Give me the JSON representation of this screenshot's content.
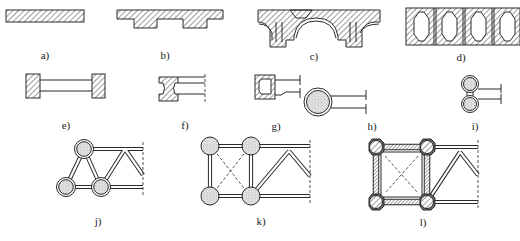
{
  "figure": {
    "panels": [
      {
        "id": "a",
        "label": "a)",
        "description": "solid rectangular plate section"
      },
      {
        "id": "b",
        "label": "b)",
        "description": "plate with two downward ribs"
      },
      {
        "id": "c",
        "label": "c)",
        "description": "double-arch section with hatched walls"
      },
      {
        "id": "d",
        "label": "d)",
        "description": "four hollow cells with octagonal voids"
      },
      {
        "id": "e",
        "label": "e)",
        "description": "two solid end blocks joined by web"
      },
      {
        "id": "f",
        "label": "f)",
        "description": "I-shaped flange member with web"
      },
      {
        "id": "g",
        "label": "g)",
        "description": "hollow box section with web lines"
      },
      {
        "id": "h",
        "label": "h)",
        "description": "concrete-filled circular tube with web"
      },
      {
        "id": "i",
        "label": "i)",
        "description": "two concrete-filled tubes stacked"
      },
      {
        "id": "j",
        "label": "j)",
        "description": "triangular truss with filled tube chords"
      },
      {
        "id": "k",
        "label": "k)",
        "description": "four-chord truss with filled tubes and cross bracing"
      },
      {
        "id": "l",
        "label": "l)",
        "description": "four-chord truss with encased chords and cross bracing"
      }
    ]
  },
  "colors": {
    "stroke": "#2a2a2a",
    "background": "#ffffff",
    "stipple": "#bdbdbd"
  }
}
